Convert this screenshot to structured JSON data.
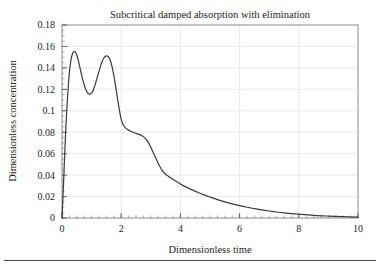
{
  "chart_data": {
    "type": "line",
    "title": "Subcritical damped absorption with elimination",
    "xlabel": "Dimensionless time",
    "ylabel": "Dimensionless concentration",
    "xlim": [
      0,
      10
    ],
    "ylim": [
      0,
      0.18
    ],
    "grid": true,
    "legend": null,
    "xticks": [
      0,
      2,
      4,
      6,
      8,
      10
    ],
    "xtick_labels": [
      "0",
      "2",
      "4",
      "6",
      "8",
      "10"
    ],
    "xminor_step": 0.25,
    "yticks": [
      0,
      0.02,
      0.04,
      0.06,
      0.08,
      0.1,
      0.12,
      0.14,
      0.16,
      0.18
    ],
    "ytick_labels": [
      "0",
      "0.02",
      "0.04",
      "0.06",
      "0.08",
      "0.1",
      "0.12",
      "0.14",
      "0.16",
      "0.18"
    ],
    "yminor_step": 0.005,
    "line_color": "#3a3a3a",
    "line_width": 1.2,
    "series": [
      {
        "name": "concentration",
        "x": [
          0.0,
          0.04,
          0.08,
          0.12,
          0.16,
          0.2,
          0.25,
          0.3,
          0.35,
          0.4,
          0.45,
          0.5,
          0.55,
          0.6,
          0.65,
          0.7,
          0.75,
          0.8,
          0.85,
          0.9,
          0.95,
          1.0,
          1.05,
          1.1,
          1.15,
          1.2,
          1.25,
          1.3,
          1.35,
          1.4,
          1.45,
          1.5,
          1.55,
          1.6,
          1.65,
          1.7,
          1.75,
          1.8,
          1.85,
          1.9,
          1.95,
          2.0,
          2.05,
          2.1,
          2.15,
          2.2,
          2.3,
          2.4,
          2.5,
          2.6,
          2.7,
          2.8,
          2.9,
          3.0,
          3.1,
          3.2,
          3.3,
          3.4,
          3.5,
          3.6,
          3.8,
          4.0,
          4.2,
          4.4,
          4.6,
          4.8,
          5.0,
          5.25,
          5.5,
          5.75,
          6.0,
          6.25,
          6.5,
          6.75,
          7.0,
          7.25,
          7.5,
          7.75,
          8.0,
          8.5,
          9.0,
          9.5,
          10.0
        ],
        "y": [
          0.0,
          0.024,
          0.052,
          0.078,
          0.1,
          0.118,
          0.136,
          0.147,
          0.153,
          0.1552,
          0.1548,
          0.152,
          0.147,
          0.141,
          0.135,
          0.129,
          0.124,
          0.12,
          0.1172,
          0.1158,
          0.1155,
          0.1165,
          0.119,
          0.1228,
          0.1272,
          0.132,
          0.1368,
          0.1414,
          0.1455,
          0.1486,
          0.1504,
          0.1512,
          0.1508,
          0.149,
          0.1455,
          0.14,
          0.133,
          0.1248,
          0.116,
          0.1072,
          0.099,
          0.092,
          0.088,
          0.0856,
          0.084,
          0.0828,
          0.0812,
          0.08,
          0.079,
          0.078,
          0.0768,
          0.0748,
          0.0712,
          0.066,
          0.06,
          0.054,
          0.0482,
          0.0438,
          0.0408,
          0.0388,
          0.0352,
          0.0318,
          0.0288,
          0.0262,
          0.0238,
          0.0216,
          0.0196,
          0.0172,
          0.0151,
          0.0132,
          0.0115,
          0.01,
          0.0087,
          0.0075,
          0.0065,
          0.0056,
          0.0048,
          0.0041,
          0.0035,
          0.0025,
          0.0018,
          0.0012,
          0.0008
        ]
      }
    ]
  },
  "axes": {
    "frame_color": "#8a8a8a",
    "grid_color": "#e2e2e2"
  }
}
